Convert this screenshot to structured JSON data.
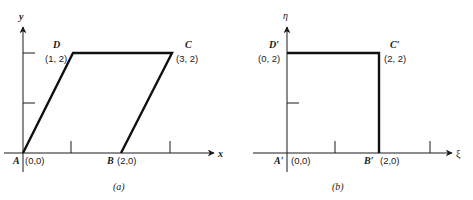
{
  "panel_a": {
    "caption": "(a)",
    "x_axis_label": "x",
    "y_axis_label": "y",
    "vertices": [
      {
        "name": "A",
        "coord": "(0,0)"
      },
      {
        "name": "B",
        "coord": "(2,0)"
      },
      {
        "name": "C",
        "coord": "(3, 2)"
      },
      {
        "name": "D",
        "coord": "(1, 2)"
      }
    ]
  },
  "panel_b": {
    "caption": "(b)",
    "x_axis_label": "ξ",
    "y_axis_label": "η",
    "vertices": [
      {
        "name": "A′",
        "coord": "(0,0)"
      },
      {
        "name": "B′",
        "coord": "(2,0)"
      },
      {
        "name": "C′",
        "coord": "(2, 2)"
      },
      {
        "name": "D′",
        "coord": "(0, 2)"
      }
    ]
  },
  "colors": {
    "line": "#111111",
    "background": "#ffffff"
  }
}
